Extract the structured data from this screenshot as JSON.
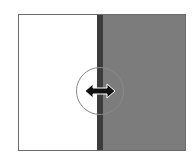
{
  "widget": {
    "type": "split-view-resizer",
    "left_pane_color": "#ffffff",
    "right_pane_color": "#7c7c7c",
    "divider_color": "#3c3c3c",
    "handle_icon": "horizontal-double-arrow-icon"
  }
}
